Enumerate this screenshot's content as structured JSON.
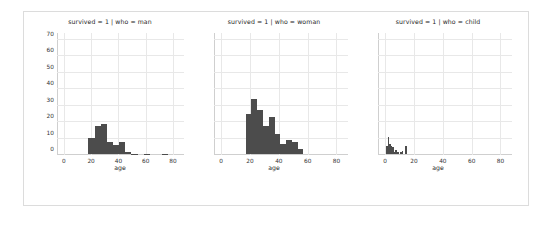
{
  "figure": {
    "background": "#ffffff",
    "frame_color": "#dcdcdc",
    "bar_color": "#4c4c4c",
    "grid_color": "#e8e8e8"
  },
  "chart_data": {
    "type": "bar",
    "title": "",
    "xlabel": "age",
    "ylabel": "",
    "xlim": [
      -5,
      88
    ],
    "ylim": [
      0,
      74
    ],
    "xticks": [
      0,
      20,
      40,
      60,
      80
    ],
    "yticks": [
      0,
      10,
      20,
      30,
      40,
      50,
      60,
      70
    ],
    "xtick_labels": [
      "0",
      "20",
      "40",
      "60",
      "80"
    ],
    "ytick_labels": [
      "0",
      "10",
      "20",
      "30",
      "40",
      "50",
      "60",
      "70"
    ],
    "grid": true,
    "legend": "none",
    "panels": [
      {
        "title": "survived = 1 | who = man",
        "xlabel": "age",
        "bin_edges": [
          18,
          22.5,
          27,
          31.5,
          36,
          40.5,
          45,
          49.5,
          54,
          58.5,
          63,
          67.5,
          72,
          76.5,
          81
        ],
        "values": [
          9.5,
          17,
          18.5,
          7.5,
          5.5,
          7,
          1.5,
          0.3,
          0,
          0.3,
          0,
          0,
          0.3,
          0
        ]
      },
      {
        "title": "survived = 1 | who = woman",
        "xlabel": "age",
        "bin_edges": [
          17,
          21,
          25,
          29,
          33,
          37,
          41,
          45,
          49,
          53,
          57,
          61
        ],
        "values": [
          24,
          33.5,
          26.5,
          17,
          22.5,
          12,
          6,
          8.5,
          7,
          3
        ]
      },
      {
        "title": "survived = 1 | who = child",
        "xlabel": "age",
        "bin_edges": [
          0.5,
          1.6,
          2.7,
          3.8,
          4.9,
          6,
          7.1,
          8.2,
          9.3,
          10.4,
          11.5,
          12.6,
          13.7,
          14.8,
          15.9
        ],
        "values": [
          5,
          10.5,
          6,
          5,
          4.5,
          1,
          2.5,
          1,
          0,
          1.5,
          2,
          0,
          5,
          0
        ]
      }
    ]
  }
}
